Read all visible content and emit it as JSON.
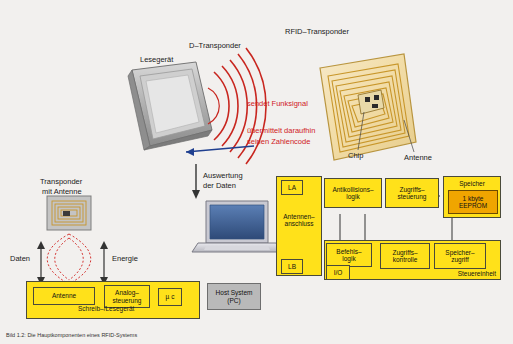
{
  "figure": {
    "background_color": "#f2f0ee",
    "caption": "Bild 1.2: Die Hauptkomponenten eines RFID-Systems"
  },
  "labels": {
    "d_transponder": "D–Transponder",
    "rfid_transponder": "RFID–Transponder",
    "lesegeraet": "Lesegerät",
    "sendet_funksignal": "sendet Funksignal",
    "uebermittelt_1": "übermittelt daraufhin",
    "uebermittelt_2": "seinen Zahlencode",
    "auswertung_1": "Auswertung",
    "auswertung_2": "der Daten",
    "chip": "Chip",
    "antenne_right": "Antenne",
    "transponder_mit_1": "Transponder",
    "transponder_mit_2": "mit Antenne",
    "daten": "Daten",
    "energie": "Energie",
    "schreib_lesegeraet": "Schreib–/Lesegerät"
  },
  "reader_blocks": {
    "antenne": "Antenne",
    "analogsteuerung": "Analog–\nsteuerung",
    "mikrocontroller": "µ c",
    "host_system": "Host System\n(PC)"
  },
  "chip_blocks": {
    "la": "LA",
    "lb": "LB",
    "antennenanschluss": "Antennen–\nanschluss",
    "antikollisionslogik": "Antikollisions–\nlogik",
    "zugriffssteuerung": "Zugriffs–\nsteuerung",
    "speicher": "Speicher",
    "eeprom": "1 kbyte\nEEPROM",
    "befehlslogik": "Befehls–\nlogik",
    "io": "I/O",
    "zugriffskontrolle": "Zugriffs–\nkontrolle",
    "speicherzugriff": "Speicher–\nzugriff",
    "steuereinheit": "Steuereinheit"
  },
  "colors": {
    "yellow": "#ffe11a",
    "gray": "#b9b9b9",
    "orange": "#f0a500",
    "red": "#d0201e",
    "wave_red": "#c8261f",
    "blue_arrow": "#1f3f8f",
    "transponder_gold": "#c8962a"
  }
}
